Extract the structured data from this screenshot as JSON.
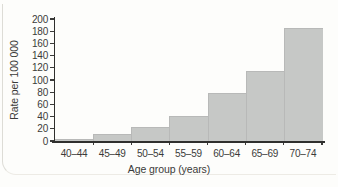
{
  "figure": {
    "background_color": "#fdfdfb",
    "bar_color": "#c6c8c6",
    "axis_color": "#2f2f2d",
    "text_color": "#3b3b39"
  },
  "chart_data": {
    "type": "bar",
    "style": "histogram-contiguous-bars",
    "title": "",
    "xlabel": "Age group (years)",
    "ylabel": "Rate per 100 000",
    "categories": [
      "40–44",
      "45–49",
      "50–54",
      "55–59",
      "60–64",
      "65–69",
      "70–74"
    ],
    "values": [
      3,
      11,
      23,
      41,
      78,
      115,
      185
    ],
    "ylim": [
      0,
      200
    ],
    "ytick_step": 20,
    "yticks": [
      0,
      20,
      40,
      60,
      80,
      100,
      120,
      140,
      160,
      180,
      200
    ],
    "grid": false,
    "legend": "none"
  }
}
